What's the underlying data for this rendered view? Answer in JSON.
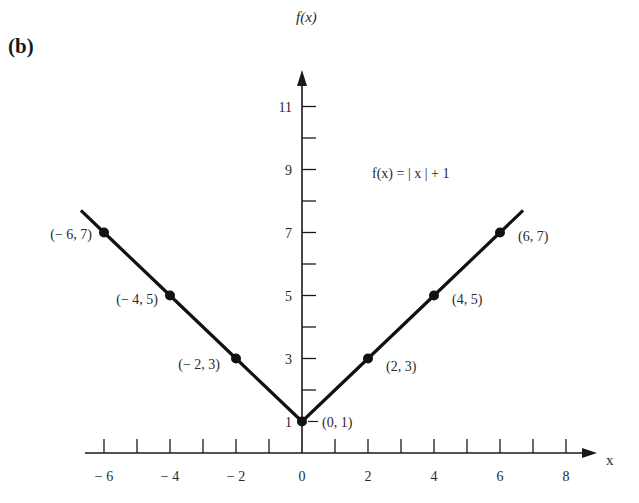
{
  "panel_label": "(b)",
  "chart_data": {
    "type": "line",
    "title": "",
    "equation": "f(x) = | x | + 1",
    "xlabel": "x",
    "ylabel": "f(x)",
    "xlim": [
      -6.5,
      8.5
    ],
    "ylim": [
      0,
      12
    ],
    "x_tick_labels": [
      "-6",
      "-4",
      "-2",
      "0",
      "2",
      "4",
      "6",
      "8"
    ],
    "y_tick_labels": [
      "1",
      "3",
      "5",
      "7",
      "9",
      "11"
    ],
    "grid": false,
    "legend": "none",
    "series": [
      {
        "name": "f(x) = |x| + 1",
        "x": [
          -6,
          -4,
          -2,
          0,
          2,
          4,
          6
        ],
        "y": [
          7,
          5,
          3,
          1,
          3,
          5,
          7
        ]
      }
    ],
    "points": [
      {
        "x": -6,
        "y": 7,
        "label": "(-6, 7)"
      },
      {
        "x": -4,
        "y": 5,
        "label": "(-4, 5)"
      },
      {
        "x": -2,
        "y": 3,
        "label": "(-2, 3)"
      },
      {
        "x": 0,
        "y": 1,
        "label": "(0, 1)"
      },
      {
        "x": 2,
        "y": 3,
        "label": "(2, 3)"
      },
      {
        "x": 4,
        "y": 5,
        "label": "(4, 5)"
      },
      {
        "x": 6,
        "y": 7,
        "label": "(6, 7)"
      }
    ]
  }
}
